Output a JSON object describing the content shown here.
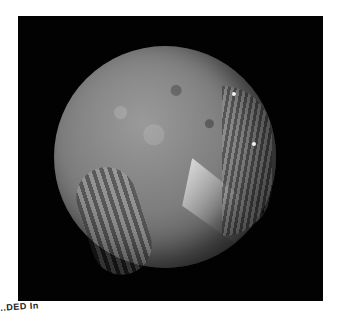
{
  "image": {
    "subject": "Grayscale photograph of a cratered moon (Miranda-like) with chevron and grooved terrain on black background",
    "background_color": "#020202",
    "page_color": "#ffffff"
  },
  "caption": {
    "text": "..DED In"
  }
}
